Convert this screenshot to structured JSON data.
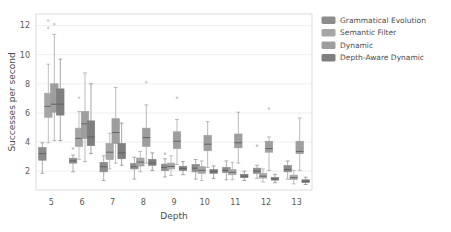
{
  "chart_data": {
    "type": "box",
    "title": "",
    "xlabel": "Depth",
    "ylabel": "Successes per second",
    "xticklabels": [
      "5",
      "6",
      "7",
      "8",
      "9",
      "10",
      "11",
      "12",
      "13"
    ],
    "yticklabels": [
      "2",
      "4",
      "6",
      "8",
      "10",
      "12"
    ],
    "ytickvalues": [
      2,
      4,
      6,
      8,
      10,
      12
    ],
    "ylim": [
      0.7,
      12.8
    ],
    "xlim": [
      4.5,
      13.5
    ],
    "grid": true,
    "legend_position": "upper right outside",
    "legend": [
      {
        "name": "Grammatical Evolution",
        "color": "#8c8c8c"
      },
      {
        "name": "Semantic Filter",
        "color": "#a6a6a6"
      },
      {
        "name": "Dynamic",
        "color": "#9e9e9e"
      },
      {
        "name": "Depth-Aware Dynamic",
        "color": "#7f7f7f"
      }
    ],
    "series": [
      {
        "name": "Grammatical Evolution",
        "color": "#8c8c8c",
        "boxes": [
          {
            "x": 5,
            "q1": 2.75,
            "median": 3.2,
            "q3": 3.62,
            "whislo": 1.85,
            "whishi": 3.95,
            "fliers": []
          },
          {
            "x": 6,
            "q1": 2.55,
            "median": 2.7,
            "q3": 2.88,
            "whislo": 1.95,
            "whishi": 3.1,
            "fliers": [
              3.55
            ]
          },
          {
            "x": 7,
            "q1": 1.95,
            "median": 2.3,
            "q3": 2.6,
            "whislo": 1.35,
            "whishi": 3.05,
            "fliers": []
          },
          {
            "x": 8,
            "q1": 2.15,
            "median": 2.3,
            "q3": 2.52,
            "whislo": 1.45,
            "whishi": 2.95,
            "fliers": []
          },
          {
            "x": 9,
            "q1": 2.05,
            "median": 2.25,
            "q3": 2.48,
            "whislo": 1.6,
            "whishi": 2.85,
            "fliers": [
              3.2
            ]
          },
          {
            "x": 10,
            "q1": 1.95,
            "median": 2.2,
            "q3": 2.45,
            "whislo": 1.45,
            "whishi": 2.8,
            "fliers": []
          },
          {
            "x": 11,
            "q1": 1.9,
            "median": 2.05,
            "q3": 2.25,
            "whislo": 1.4,
            "whishi": 2.7,
            "fliers": []
          },
          {
            "x": 12,
            "q1": 1.85,
            "median": 2.0,
            "q3": 2.2,
            "whislo": 1.5,
            "whishi": 2.4,
            "fliers": [
              3.75
            ]
          },
          {
            "x": 13,
            "q1": 1.95,
            "median": 2.1,
            "q3": 2.38,
            "whislo": 1.45,
            "whishi": 2.7,
            "fliers": []
          }
        ]
      },
      {
        "name": "Semantic Filter",
        "color": "#a6a6a6",
        "boxes": [
          {
            "x": 5,
            "q1": 5.7,
            "median": 6.45,
            "q3": 7.35,
            "whislo": 3.95,
            "whishi": 9.35,
            "fliers": [
              11.85,
              12.35
            ]
          },
          {
            "x": 6,
            "q1": 3.7,
            "median": 4.25,
            "q3": 4.95,
            "whislo": 2.8,
            "whishi": 6.1,
            "fliers": [
              7.05
            ]
          },
          {
            "x": 7,
            "q1": 2.8,
            "median": 3.3,
            "q3": 3.9,
            "whislo": 2.15,
            "whishi": 4.6,
            "fliers": []
          },
          {
            "x": 8,
            "q1": 2.35,
            "median": 2.62,
            "q3": 2.9,
            "whislo": 1.95,
            "whishi": 3.35,
            "fliers": []
          },
          {
            "x": 9,
            "q1": 2.15,
            "median": 2.32,
            "q3": 2.55,
            "whislo": 1.7,
            "whishi": 3.05,
            "fliers": []
          },
          {
            "x": 10,
            "q1": 1.85,
            "median": 2.05,
            "q3": 2.3,
            "whislo": 1.35,
            "whishi": 2.7,
            "fliers": []
          },
          {
            "x": 11,
            "q1": 1.75,
            "median": 1.92,
            "q3": 2.1,
            "whislo": 1.4,
            "whishi": 2.6,
            "fliers": []
          },
          {
            "x": 12,
            "q1": 1.52,
            "median": 1.65,
            "q3": 1.85,
            "whislo": 1.25,
            "whishi": 2.15,
            "fliers": []
          },
          {
            "x": 13,
            "q1": 1.42,
            "median": 1.55,
            "q3": 1.72,
            "whislo": 1.12,
            "whishi": 2.05,
            "fliers": []
          }
        ]
      },
      {
        "name": "Dynamic",
        "color": "#9e9e9e",
        "boxes": [
          {
            "x": 5,
            "q1": 6.05,
            "median": 6.6,
            "q3": 8.0,
            "whislo": 4.1,
            "whishi": 11.4,
            "fliers": [
              12.1
            ]
          },
          {
            "x": 6,
            "q1": 4.25,
            "median": 5.25,
            "q3": 6.1,
            "whislo": 2.65,
            "whishi": 8.75,
            "fliers": []
          },
          {
            "x": 7,
            "q1": 3.9,
            "median": 4.65,
            "q3": 5.6,
            "whislo": 2.55,
            "whishi": 7.75,
            "fliers": []
          },
          {
            "x": 8,
            "q1": 3.7,
            "median": 4.3,
            "q3": 4.95,
            "whislo": 2.55,
            "whishi": 6.55,
            "fliers": [
              8.1
            ]
          },
          {
            "x": 9,
            "q1": 3.55,
            "median": 4.05,
            "q3": 4.7,
            "whislo": 2.45,
            "whishi": 5.55,
            "fliers": [
              7.05
            ]
          },
          {
            "x": 10,
            "q1": 3.4,
            "median": 3.85,
            "q3": 4.45,
            "whislo": 2.25,
            "whishi": 5.4,
            "fliers": []
          },
          {
            "x": 11,
            "q1": 3.6,
            "median": 3.95,
            "q3": 4.55,
            "whislo": 2.55,
            "whishi": 6.05,
            "fliers": []
          },
          {
            "x": 12,
            "q1": 3.3,
            "median": 3.55,
            "q3": 4.05,
            "whislo": 2.05,
            "whishi": 4.35,
            "fliers": [
              6.3
            ]
          },
          {
            "x": 13,
            "q1": 3.2,
            "median": 3.35,
            "q3": 4.05,
            "whislo": 2.05,
            "whishi": 5.65,
            "fliers": []
          }
        ]
      },
      {
        "name": "Depth-Aware Dynamic",
        "color": "#7f7f7f",
        "boxes": [
          {
            "x": 5,
            "q1": 5.85,
            "median": 6.6,
            "q3": 7.65,
            "whislo": 4.1,
            "whishi": 9.7,
            "fliers": []
          },
          {
            "x": 6,
            "q1": 3.75,
            "median": 4.35,
            "q3": 5.45,
            "whislo": 3.2,
            "whishi": 8.0,
            "fliers": []
          },
          {
            "x": 7,
            "q1": 2.85,
            "median": 3.25,
            "q3": 3.9,
            "whislo": 2.4,
            "whishi": 5.3,
            "fliers": []
          },
          {
            "x": 8,
            "q1": 2.4,
            "median": 2.55,
            "q3": 2.8,
            "whislo": 2.05,
            "whishi": 3.25,
            "fliers": []
          },
          {
            "x": 9,
            "q1": 2.05,
            "median": 2.18,
            "q3": 2.32,
            "whislo": 1.75,
            "whishi": 2.65,
            "fliers": []
          },
          {
            "x": 10,
            "q1": 1.85,
            "median": 1.98,
            "q3": 2.1,
            "whislo": 1.5,
            "whishi": 2.35,
            "fliers": []
          },
          {
            "x": 11,
            "q1": 1.55,
            "median": 1.65,
            "q3": 1.78,
            "whislo": 1.35,
            "whishi": 2.0,
            "fliers": []
          },
          {
            "x": 12,
            "q1": 1.38,
            "median": 1.46,
            "q3": 1.55,
            "whislo": 1.2,
            "whishi": 1.78,
            "fliers": []
          },
          {
            "x": 13,
            "q1": 1.22,
            "median": 1.3,
            "q3": 1.4,
            "whislo": 1.08,
            "whishi": 1.58,
            "fliers": []
          }
        ]
      }
    ]
  },
  "figure": {
    "background": "#ffffff",
    "frame_color": "#d3d3d8",
    "grid_color": "#e8e8ec",
    "text_color": "#4d4d4d"
  }
}
